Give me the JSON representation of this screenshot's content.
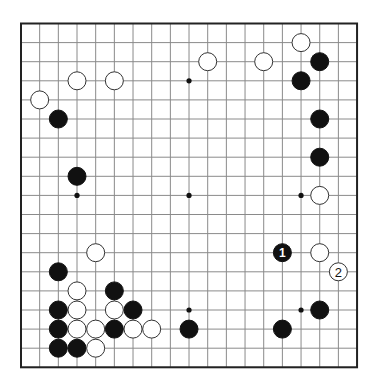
{
  "board": {
    "size": 19,
    "origin_x": 21,
    "origin_y": 23.5,
    "spacing_x": 18.67,
    "spacing_y": 19.1,
    "stone_radius": 9,
    "colors": {
      "black": "#111111",
      "white": "#ffffff",
      "grid": "#8a8a8a",
      "border": "#222222"
    }
  },
  "star_points": [
    [
      3,
      3
    ],
    [
      9,
      3
    ],
    [
      15,
      3
    ],
    [
      3,
      9
    ],
    [
      9,
      9
    ],
    [
      15,
      9
    ],
    [
      3,
      15
    ],
    [
      9,
      15
    ],
    [
      15,
      15
    ]
  ],
  "stones": [
    {
      "color": "black",
      "col": 2,
      "row": 5
    },
    {
      "color": "black",
      "col": 3,
      "row": 8
    },
    {
      "color": "black",
      "col": 16,
      "row": 2
    },
    {
      "color": "black",
      "col": 15,
      "row": 3
    },
    {
      "color": "black",
      "col": 16,
      "row": 5
    },
    {
      "color": "black",
      "col": 16,
      "row": 7
    },
    {
      "color": "black",
      "col": 14,
      "row": 12,
      "label": "1"
    },
    {
      "color": "black",
      "col": 16,
      "row": 15
    },
    {
      "color": "black",
      "col": 14,
      "row": 16
    },
    {
      "color": "black",
      "col": 9,
      "row": 16
    },
    {
      "color": "black",
      "col": 2,
      "row": 13
    },
    {
      "color": "black",
      "col": 5,
      "row": 14
    },
    {
      "color": "black",
      "col": 2,
      "row": 15
    },
    {
      "color": "black",
      "col": 6,
      "row": 15
    },
    {
      "color": "black",
      "col": 2,
      "row": 16
    },
    {
      "color": "black",
      "col": 5,
      "row": 16
    },
    {
      "color": "black",
      "col": 2,
      "row": 17
    },
    {
      "color": "black",
      "col": 3,
      "row": 17
    },
    {
      "color": "white",
      "col": 3,
      "row": 3
    },
    {
      "color": "white",
      "col": 5,
      "row": 3
    },
    {
      "color": "white",
      "col": 1,
      "row": 4
    },
    {
      "color": "white",
      "col": 10,
      "row": 2
    },
    {
      "color": "white",
      "col": 13,
      "row": 2
    },
    {
      "color": "white",
      "col": 15,
      "row": 1
    },
    {
      "color": "white",
      "col": 16,
      "row": 9
    },
    {
      "color": "white",
      "col": 16,
      "row": 12
    },
    {
      "color": "white",
      "col": 17,
      "row": 13,
      "label": "2"
    },
    {
      "color": "white",
      "col": 4,
      "row": 12
    },
    {
      "color": "white",
      "col": 3,
      "row": 14
    },
    {
      "color": "white",
      "col": 3,
      "row": 15
    },
    {
      "color": "white",
      "col": 5,
      "row": 15
    },
    {
      "color": "white",
      "col": 3,
      "row": 16
    },
    {
      "color": "white",
      "col": 4,
      "row": 16
    },
    {
      "color": "white",
      "col": 6,
      "row": 16
    },
    {
      "color": "white",
      "col": 7,
      "row": 16
    },
    {
      "color": "white",
      "col": 4,
      "row": 17
    }
  ]
}
